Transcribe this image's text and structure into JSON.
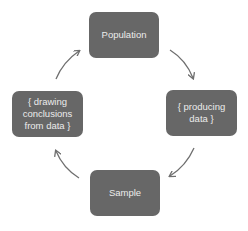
{
  "diagram": {
    "type": "cycle",
    "box_color": "#676767",
    "text_color": "#ececec",
    "arrow_color": "#6f6f6f",
    "nodes": [
      {
        "id": "population",
        "label": "Population"
      },
      {
        "id": "producing",
        "label": "{ producing\ndata }"
      },
      {
        "id": "sample",
        "label": "Sample"
      },
      {
        "id": "drawing",
        "label": "{ drawing\nconclusions\nfrom data }"
      }
    ],
    "edges": [
      {
        "from": "population",
        "to": "producing"
      },
      {
        "from": "producing",
        "to": "sample"
      },
      {
        "from": "sample",
        "to": "drawing"
      },
      {
        "from": "drawing",
        "to": "population"
      }
    ]
  }
}
